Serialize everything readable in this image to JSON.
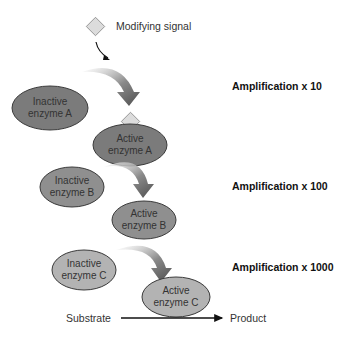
{
  "diagram": {
    "signal_label": "Modifying signal",
    "enzymes": {
      "inactive_a": "Inactive enzyme A",
      "active_a": "Active enzyme A",
      "inactive_b": "Inactive enzyme B",
      "active_b": "Active enzyme B",
      "inactive_c": "Inactive enzyme C",
      "active_c": "Active enzyme C"
    },
    "enzyme_lines": {
      "inactive_a": [
        "Inactive",
        "enzyme A"
      ],
      "active_a": [
        "Active",
        "enzyme A"
      ],
      "inactive_b": [
        "Inactive",
        "enzyme B"
      ],
      "active_b": [
        "Active",
        "enzyme B"
      ],
      "inactive_c": [
        "Inactive",
        "enzyme C"
      ],
      "active_c": [
        "Active",
        "enzyme C"
      ]
    },
    "amplification": [
      {
        "label": "Amplification x 10"
      },
      {
        "label": "Amplification x 100"
      },
      {
        "label": "Amplification x 1000"
      }
    ],
    "arrow_marks": [
      "x10",
      "x10",
      "x10"
    ],
    "substrate_label": "Substrate",
    "product_label": "Product",
    "colors": {
      "enzyme_a": "#7b7b7b",
      "enzyme_b": "#8f8f8f",
      "enzyme_c": "#b3b3b3",
      "diamond": "#dcdcdc",
      "arrow": "#6a6a6a"
    }
  }
}
